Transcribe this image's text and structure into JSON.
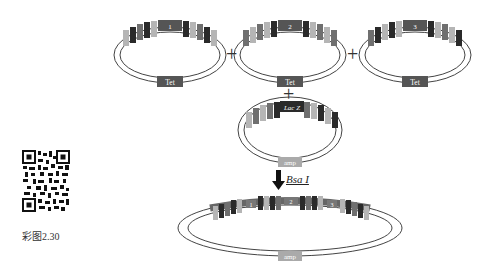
{
  "figure": {
    "caption": "彩图2.30",
    "enzyme_label": "Bsa I",
    "plus_sign": "+",
    "plasmids": [
      {
        "id": "donor-1",
        "center_label": "1",
        "marker": "Tet",
        "marker_color": "#555555"
      },
      {
        "id": "donor-2",
        "center_label": "2",
        "marker": "Tet",
        "marker_color": "#555555"
      },
      {
        "id": "donor-3",
        "center_label": "3",
        "marker": "Tet",
        "marker_color": "#555555"
      },
      {
        "id": "acceptor",
        "center_label": "Lac Z",
        "marker": "amp",
        "marker_color": "#999999"
      },
      {
        "id": "product",
        "segments": [
          "1",
          "2",
          "3"
        ],
        "marker": "amp",
        "marker_color": "#999999"
      }
    ],
    "colors": {
      "dark": "#2a2a2a",
      "mid": "#6f6f6f",
      "light": "#b5b5b5",
      "ring": "#444444"
    }
  }
}
